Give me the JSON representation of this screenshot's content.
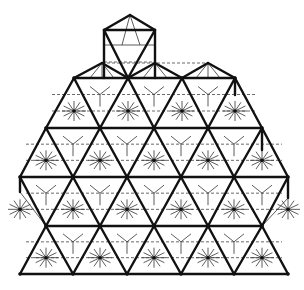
{
  "figure": {
    "colors": {
      "background": "#ffffff",
      "edge": "#111111",
      "hidden": "#444444"
    },
    "cap": {
      "apex": [
        130,
        15
      ],
      "square": [
        [
          104,
          30
        ],
        [
          155,
          30
        ],
        [
          155,
          78
        ],
        [
          104,
          78
        ]
      ]
    },
    "rows": [
      {
        "y": 63,
        "xs": [
          102,
          155,
          208
        ]
      },
      {
        "y": 78,
        "xs": [
          74,
          128,
          182,
          235
        ]
      },
      {
        "y": 113,
        "xs": [
          73,
          127,
          181,
          234
        ]
      },
      {
        "y": 128,
        "xs": [
          46,
          100,
          154,
          208,
          262
        ]
      },
      {
        "y": 162,
        "xs": [
          46,
          100,
          154,
          208,
          262
        ]
      },
      {
        "y": 177,
        "xs": [
          20,
          73,
          127,
          181,
          234,
          288
        ]
      },
      {
        "y": 210,
        "xs": [
          46,
          100,
          154,
          208,
          262
        ]
      },
      {
        "y": 226,
        "xs": [
          46,
          100,
          154,
          208,
          262
        ]
      },
      {
        "y": 258,
        "xs": [
          73,
          127,
          181,
          234
        ]
      },
      {
        "y": 274,
        "xs": [
          20,
          73,
          127,
          181,
          234,
          288
        ]
      }
    ]
  }
}
